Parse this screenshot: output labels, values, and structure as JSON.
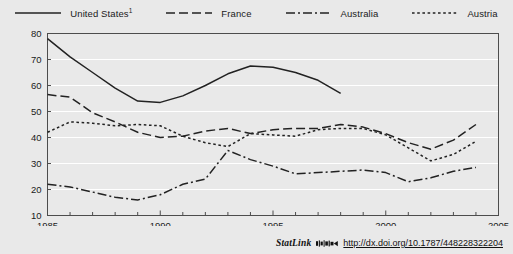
{
  "footer": {
    "statlink_label": "StatLink",
    "statlink_icon": "statlink-barcode-icon",
    "url": "http://dx.doi.org/10.1787/448228322204"
  },
  "chart_data": {
    "type": "line",
    "title": "",
    "xlabel": "",
    "ylabel": "",
    "xlim": [
      1985,
      2005
    ],
    "ylim": [
      10,
      80
    ],
    "ytick_step": 10,
    "yticks": [
      10,
      20,
      30,
      40,
      50,
      60,
      70,
      80
    ],
    "xticks": [
      1985,
      1990,
      1995,
      2000,
      2005
    ],
    "xtick_labels": [
      "1985",
      "1990",
      "1995",
      "2000",
      "2005"
    ],
    "x_minor_tick_step": 1,
    "grid": "horizontal",
    "grid_color": "#ffffff",
    "background": "#e9e9e9",
    "plot_background": "#e9e9e9",
    "border_color": "#4d4d4d",
    "line_color": "#222222",
    "legend_position": "top",
    "series": [
      {
        "name": "United States",
        "footnote": "1",
        "label": "United States¹",
        "style": "solid",
        "dasharray": "",
        "x": [
          1985,
          1986,
          1987,
          1988,
          1989,
          1990,
          1991,
          1992,
          1993,
          1994,
          1995,
          1996,
          1997,
          1998
        ],
        "values": [
          78.0,
          71.0,
          65.0,
          59.0,
          54.0,
          53.5,
          56.0,
          60.0,
          64.5,
          67.5,
          67.0,
          65.0,
          62.0,
          57.0
        ]
      },
      {
        "name": "France",
        "label": "France",
        "style": "dashed",
        "dasharray": "9,4",
        "x": [
          1985,
          1986,
          1987,
          1988,
          1989,
          1990,
          1991,
          1992,
          1993,
          1994,
          1995,
          1996,
          1997,
          1998,
          1999,
          2000,
          2001,
          2002,
          2003,
          2004
        ],
        "values": [
          56.5,
          55.5,
          49.5,
          46.0,
          42.0,
          40.0,
          40.5,
          42.5,
          43.5,
          41.5,
          43.0,
          43.5,
          43.5,
          45.0,
          44.0,
          41.5,
          38.0,
          35.5,
          39.0,
          45.0
        ]
      },
      {
        "name": "Australia",
        "label": "Australia",
        "style": "dash-dot",
        "dasharray": "9,3,2,3",
        "x": [
          1985,
          1986,
          1987,
          1988,
          1989,
          1990,
          1991,
          1992,
          1993,
          1994,
          1995,
          1996,
          1997,
          1998,
          1999,
          2000,
          2001,
          2002,
          2003,
          2004
        ],
        "values": [
          22.0,
          21.0,
          19.0,
          17.0,
          16.0,
          18.0,
          22.0,
          24.0,
          35.0,
          31.5,
          29.0,
          26.0,
          26.5,
          27.0,
          27.5,
          26.5,
          23.0,
          24.5,
          27.0,
          28.5
        ]
      },
      {
        "name": "Austria",
        "label": "Austria",
        "style": "dotted",
        "dasharray": "2.6,2.6",
        "x": [
          1985,
          1986,
          1987,
          1988,
          1989,
          1990,
          1991,
          1992,
          1993,
          1994,
          1995,
          1996,
          1997,
          1998,
          1999,
          2000,
          2001,
          2002,
          2003,
          2004
        ],
        "values": [
          42.0,
          46.0,
          45.5,
          44.5,
          45.0,
          44.5,
          40.5,
          38.0,
          36.5,
          41.5,
          41.0,
          40.5,
          43.0,
          43.5,
          43.5,
          41.0,
          36.0,
          31.0,
          33.5,
          38.5
        ]
      }
    ]
  }
}
